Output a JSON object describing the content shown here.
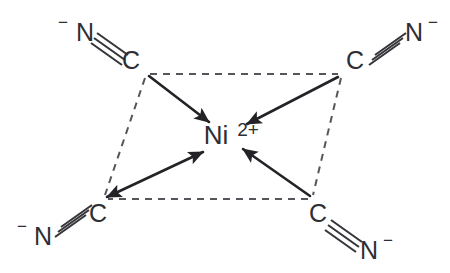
{
  "figure": {
    "background_color": "#ffffff",
    "line_color": "#35353a",
    "dashed_color": "#55555c",
    "arrow_color": "#232327",
    "text_color": "#2e2e33"
  },
  "center": {
    "symbol": "Ni",
    "charge": "2+",
    "name": "nickel-center"
  },
  "ligands": [
    {
      "id": "top-left",
      "position": "top-left",
      "charge": "−",
      "nitrogen": "N",
      "carbon": "C",
      "bond_order": 3,
      "donates_to_center": true
    },
    {
      "id": "top-right",
      "position": "top-right",
      "charge": "−",
      "nitrogen": "N",
      "carbon": "C",
      "bond_order": 3,
      "donates_to_center": true
    },
    {
      "id": "bottom-left",
      "position": "bottom-left",
      "charge": "−",
      "nitrogen": "N",
      "carbon": "C",
      "bond_order": 3,
      "donates_to_center": true
    },
    {
      "id": "bottom-right",
      "position": "bottom-right",
      "charge": "−",
      "nitrogen": "N",
      "carbon": "C",
      "bond_order": 3,
      "donates_to_center": true
    }
  ],
  "geometry": {
    "shape": "square-planar-perspective",
    "vertices": [
      {
        "name": "top-left",
        "x": 147,
        "y": 74
      },
      {
        "name": "top-right",
        "x": 341,
        "y": 74
      },
      {
        "name": "bottom-right",
        "x": 311,
        "y": 199
      },
      {
        "name": "bottom-left",
        "x": 104,
        "y": 199
      }
    ]
  },
  "labels": {
    "top_left_charge": "−",
    "top_left_n": "N",
    "top_left_c": "C",
    "top_right_c": "C",
    "top_right_n": "N",
    "top_right_charge": "−",
    "bottom_left_charge": "−",
    "bottom_left_n": "N",
    "bottom_left_c": "C",
    "bottom_right_c": "C",
    "bottom_right_n": "N",
    "bottom_right_charge": "−",
    "center_symbol": "Ni",
    "center_charge": "2+"
  }
}
